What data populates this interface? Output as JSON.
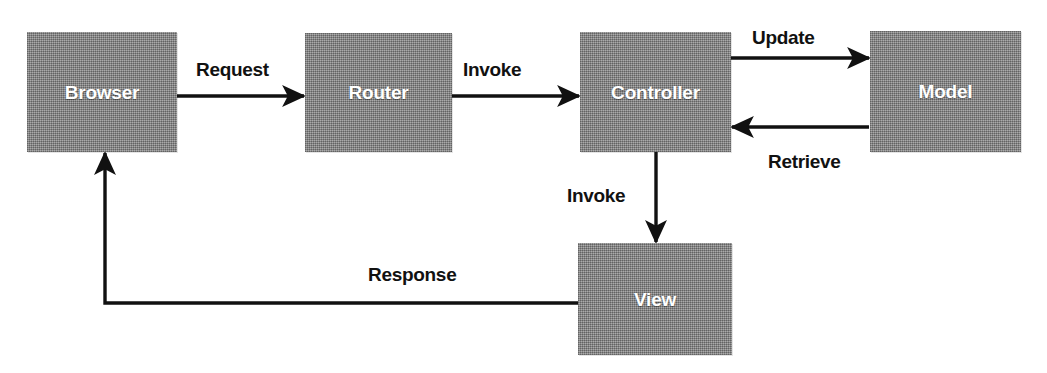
{
  "diagram": {
    "type": "flow-diagram",
    "colors": {
      "node_fill": "#8d8d8d",
      "node_label": "#ffffff",
      "edge_stroke": "#111111",
      "edge_label": "#111111",
      "background": "#ffffff"
    },
    "nodes": [
      {
        "id": "browser",
        "label": "Browser",
        "x": 27,
        "y": 32,
        "width": 150,
        "height": 120
      },
      {
        "id": "router",
        "label": "Router",
        "x": 305,
        "y": 33,
        "width": 147,
        "height": 119
      },
      {
        "id": "controller",
        "label": "Controller",
        "x": 580,
        "y": 32,
        "width": 151,
        "height": 120
      },
      {
        "id": "model",
        "label": "Model",
        "x": 870,
        "y": 31,
        "width": 151,
        "height": 121
      },
      {
        "id": "view",
        "label": "View",
        "x": 578,
        "y": 243,
        "width": 154,
        "height": 112
      }
    ],
    "edges": [
      {
        "id": "browser-to-router",
        "label": "Request",
        "from": "browser",
        "to": "router",
        "label_x": 196,
        "label_y": 60
      },
      {
        "id": "router-to-controller",
        "label": "Invoke",
        "from": "router",
        "to": "controller",
        "label_x": 463,
        "label_y": 60
      },
      {
        "id": "controller-to-model",
        "label": "Update",
        "from": "controller",
        "to": "model",
        "label_x": 752,
        "label_y": 28
      },
      {
        "id": "model-to-controller",
        "label": "Retrieve",
        "from": "model",
        "to": "controller",
        "label_x": 768,
        "label_y": 152
      },
      {
        "id": "controller-to-view",
        "label": "Invoke",
        "from": "controller",
        "to": "view",
        "label_x": 567,
        "label_y": 186
      },
      {
        "id": "view-to-browser",
        "label": "Response",
        "from": "view",
        "to": "browser",
        "label_x": 368,
        "label_y": 265
      }
    ]
  }
}
